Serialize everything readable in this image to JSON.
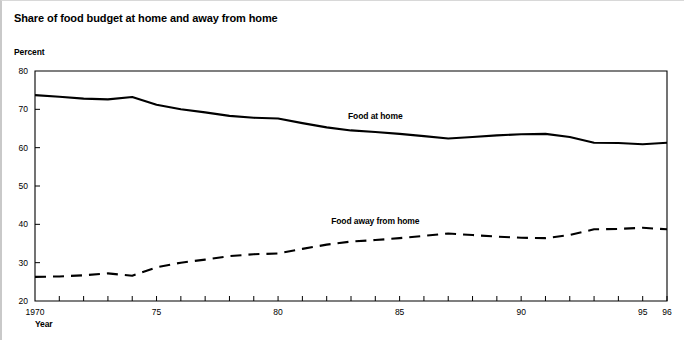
{
  "chart_data": {
    "type": "line",
    "title": "Share of food budget at home and away from home",
    "xlabel": "Year",
    "ylabel": "Percent",
    "ylim": [
      20,
      80
    ],
    "xlim": [
      1970,
      1996
    ],
    "yticks": [
      20,
      30,
      40,
      50,
      60,
      70,
      80
    ],
    "ytick_labels": [
      "20",
      "30",
      "40",
      "50",
      "60",
      "70",
      "80"
    ],
    "xticks": [
      1970,
      1971,
      1972,
      1973,
      1974,
      1975,
      1976,
      1977,
      1978,
      1979,
      1980,
      1981,
      1982,
      1983,
      1984,
      1985,
      1986,
      1987,
      1988,
      1989,
      1990,
      1991,
      1992,
      1993,
      1994,
      1995,
      1996
    ],
    "xtick_labels": [
      {
        "x": 1970,
        "label": "1970"
      },
      {
        "x": 1975,
        "label": "75"
      },
      {
        "x": 1980,
        "label": "80"
      },
      {
        "x": 1985,
        "label": "85"
      },
      {
        "x": 1990,
        "label": "90"
      },
      {
        "x": 1995,
        "label": "95"
      },
      {
        "x": 1996,
        "label": "96"
      }
    ],
    "grid": false,
    "legend_position": "inline-annotations",
    "x": [
      1970,
      1971,
      1972,
      1973,
      1974,
      1975,
      1976,
      1977,
      1978,
      1979,
      1980,
      1981,
      1982,
      1983,
      1984,
      1985,
      1986,
      1987,
      1988,
      1989,
      1990,
      1991,
      1992,
      1993,
      1994,
      1995,
      1996
    ],
    "series": [
      {
        "name": "Food at home",
        "style": "solid",
        "color": "#000000",
        "label_x": 1984.0,
        "label_y": 67.5,
        "values": [
          73.7,
          73.3,
          72.8,
          72.6,
          73.2,
          71.2,
          70.0,
          69.2,
          68.3,
          67.8,
          67.6,
          66.4,
          65.3,
          64.5,
          64.1,
          63.6,
          63.0,
          62.4,
          62.8,
          63.2,
          63.5,
          63.6,
          62.8,
          61.3,
          61.2,
          60.9,
          61.3
        ]
      },
      {
        "name": "Food away from home",
        "style": "dashed",
        "color": "#000000",
        "label_x": 1984.0,
        "label_y": 40.2,
        "values": [
          26.3,
          26.4,
          26.7,
          27.2,
          26.6,
          28.8,
          30.0,
          30.8,
          31.7,
          32.2,
          32.4,
          33.6,
          34.7,
          35.5,
          35.9,
          36.4,
          37.0,
          37.6,
          37.2,
          36.8,
          36.5,
          36.4,
          37.2,
          38.7,
          38.8,
          39.1,
          38.7
        ]
      }
    ]
  }
}
